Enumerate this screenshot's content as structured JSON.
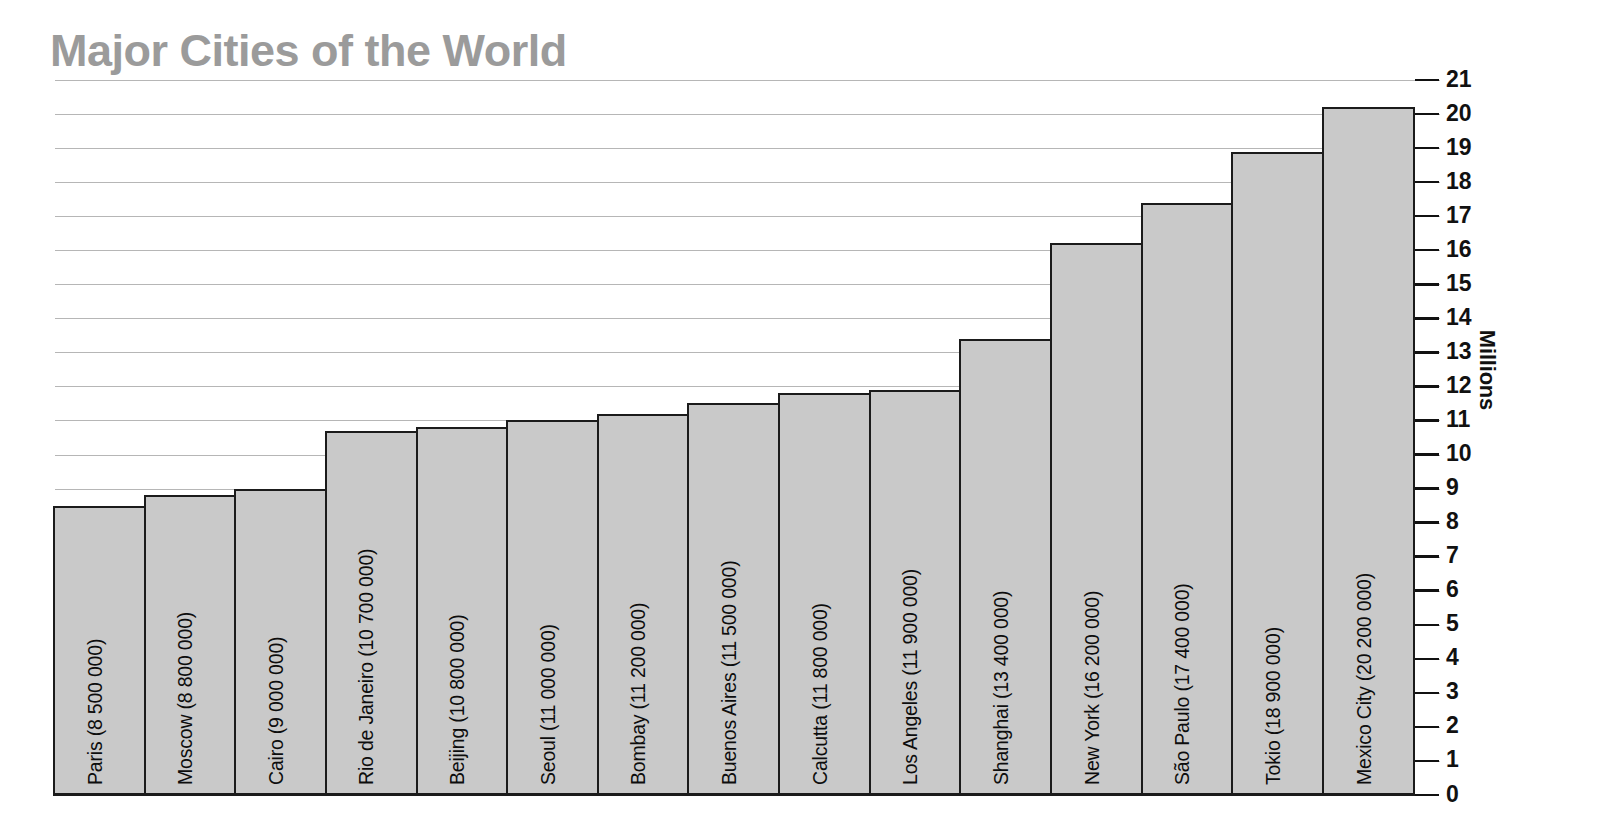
{
  "chart_data": {
    "type": "bar",
    "title": "Major Cities of the World",
    "xlabel": "",
    "ylabel": "Millions",
    "ylim": [
      0,
      21
    ],
    "grid": true,
    "legend": "none",
    "orientation": "vertical",
    "tick_step": 1,
    "value_unit": "millions",
    "categories": [
      "Paris",
      "Moscow",
      "Cairo",
      "Rio de Janeiro",
      "Beijing",
      "Seoul",
      "Bombay",
      "Buenos Aires",
      "Calcutta",
      "Los Angeles",
      "Shanghai",
      "New York",
      "São Paulo",
      "Tokio",
      "Mexico City"
    ],
    "values": [
      8.5,
      8.8,
      9.0,
      10.7,
      10.8,
      11.0,
      11.2,
      11.5,
      11.8,
      11.9,
      13.4,
      16.2,
      17.4,
      18.9,
      20.2
    ],
    "population_labels": [
      "8 500 000",
      "8 800 000",
      "9 000 000",
      "10 700 000",
      "10 800 000",
      "11 000 000",
      "11 200 000",
      "11 500 000",
      "11 800 000",
      "11 900 000",
      "13 400 000",
      "16 200 000",
      "17 400 000",
      "18 900 000",
      "20 200 000"
    ],
    "bar_labels": [
      "Paris  (8 500 000)",
      "Moscow  (8 800 000)",
      "Cairo  (9 000 000)",
      "Rio de Janeiro  (10 700 000)",
      "Beijing  (10 800 000)",
      "Seoul  (11 000 000)",
      "Bombay  (11 200 000)",
      "Buenos Aires  (11 500 000)",
      "Calcutta  (11 800 000)",
      "Los Angeles  (11 900 000)",
      "Shanghai  (13 400 000)",
      "New York  (16 200 000)",
      "São Paulo  (17 400 000)",
      "Tokio  (18 900 000)",
      "Mexico City  (20 200 000)"
    ],
    "ytick_labels": [
      "0",
      "1",
      "2",
      "3",
      "4",
      "5",
      "6",
      "7",
      "8",
      "9",
      "10",
      "11",
      "12",
      "13",
      "14",
      "15",
      "16",
      "17",
      "18",
      "19",
      "20",
      "21"
    ],
    "yticks": [
      0,
      1,
      2,
      3,
      4,
      5,
      6,
      7,
      8,
      9,
      10,
      11,
      12,
      13,
      14,
      15,
      16,
      17,
      18,
      19,
      20,
      21
    ],
    "colors": {
      "bar_fill": "#c9c9c9",
      "bar_stroke": "#1b1b1b",
      "title": "#9b9b9b",
      "gridline": "#a9a9a9",
      "text": "#111111",
      "background": "#ffffff"
    }
  }
}
